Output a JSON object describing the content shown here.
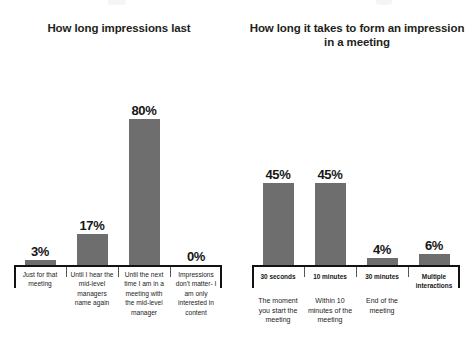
{
  "chart_data": [
    {
      "type": "bar",
      "title": "How long impressions last",
      "xlabel": "",
      "ylabel": "",
      "ylim": [
        0,
        100
      ],
      "grid": false,
      "legend": "none",
      "categories": [
        "Just for that meeting",
        "Until I hear the mid-level managers name again",
        "Until the next time I am in a meeting with the mid-level manager",
        "Impressions don't matter- I am only interested in content"
      ],
      "values": [
        3,
        17,
        80,
        0
      ],
      "value_labels": [
        "3%",
        "17%",
        "80%",
        "0%"
      ],
      "bar_color": "#6e6e6e",
      "axis_color": "#121212"
    },
    {
      "type": "bar",
      "title": "How long it takes to form an impression in a meeting",
      "xlabel": "",
      "ylabel": "",
      "ylim": [
        0,
        100
      ],
      "grid": false,
      "legend": "none",
      "categories": [
        "30 seconds",
        "10 minutes",
        "30 minutes",
        "Multiple interactions"
      ],
      "category_descriptions": [
        "The moment you start the meeting",
        "Within 10 minutes of the meeting",
        "End of the meeting",
        ""
      ],
      "values": [
        45,
        45,
        4,
        6
      ],
      "value_labels": [
        "45%",
        "45%",
        "4%",
        "6%"
      ],
      "bar_color": "#6e6e6e",
      "axis_color": "#121212"
    }
  ],
  "left_chart": {
    "title": "How long impressions last",
    "bars": [
      {
        "value_label": "3%",
        "category": "Just for that meeting"
      },
      {
        "value_label": "17%",
        "category": "Until I hear the mid-level managers name again"
      },
      {
        "value_label": "80%",
        "category": "Until the next time I am in a meeting with the mid-level manager"
      },
      {
        "value_label": "0%",
        "category": "Impressions don't matter- I am only interested in content"
      }
    ]
  },
  "right_chart": {
    "title": "How long it takes to form an impression in a meeting",
    "bars": [
      {
        "value_label": "45%",
        "category": "30 seconds",
        "description": "The moment you start the meeting"
      },
      {
        "value_label": "45%",
        "category": "10 minutes",
        "description": "Within 10 minutes of the meeting"
      },
      {
        "value_label": "4%",
        "category": "30 minutes",
        "description": "End of the meeting"
      },
      {
        "value_label": "6%",
        "category": "Multiple interactions",
        "description": ""
      }
    ]
  }
}
